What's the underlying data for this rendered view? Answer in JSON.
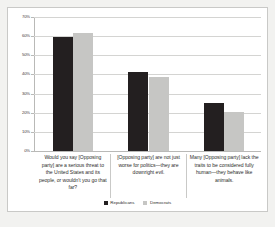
{
  "chart_data": {
    "type": "bar",
    "title": "",
    "subtitle": "",
    "xlabel": "",
    "ylabel": "",
    "ylim": [
      0,
      70
    ],
    "ytick_values": [
      0,
      10,
      20,
      30,
      40,
      50,
      60,
      70
    ],
    "ytick_labels": [
      "0%",
      "10%",
      "20%",
      "30%",
      "40%",
      "50%",
      "60%",
      "70%"
    ],
    "grid": true,
    "legend_position": "bottom",
    "categories": [
      "Would you say [Opposing party] are a serious threat to the United States and its people, or wouldn't you go that far?",
      "[Opposing party] are not just worse for politics—they are downright evil.",
      "Many [Opposing party] lack the traits to be considered fully human—they behave like animals."
    ],
    "series": [
      {
        "name": "Republicans",
        "color": "#231f20",
        "values": [
          59.7,
          41.4,
          25.0
        ]
      },
      {
        "name": "Democrats",
        "color": "#c6c6c4",
        "values": [
          61.7,
          38.7,
          20.2
        ]
      }
    ]
  }
}
